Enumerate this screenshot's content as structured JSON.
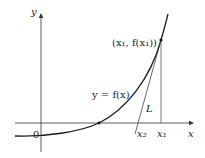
{
  "diagram": {
    "axes": {
      "x_label": "x",
      "y_label": "y",
      "origin_label": "0"
    },
    "curve_label": "y = f(x)",
    "point_label": "(x₁, f(x₁))",
    "tangent_label": "L",
    "tick_labels": {
      "x1": "x₁",
      "x2": "x₂"
    },
    "colors": {
      "curve": "#1a1a1a",
      "axes": "#333333",
      "tangent": "#444444",
      "background": "#ffffff"
    }
  }
}
